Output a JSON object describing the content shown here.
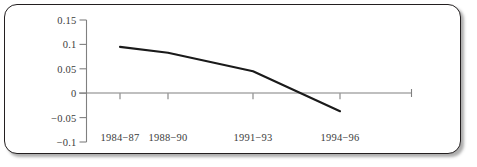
{
  "figure": {
    "frame_border_color": "#231f20",
    "background_color": "#ffffff",
    "axis_color": "#808080",
    "series_color": "#1a1a1a",
    "tick_text_color": "#3b3b3b"
  },
  "chart_data": {
    "type": "line",
    "title": "",
    "subtitle": "",
    "xlabel": "",
    "ylabel": "",
    "categories": [
      "1984−87",
      "1988−90",
      "1991−93",
      "1994−96"
    ],
    "x": [
      0,
      1,
      2,
      3
    ],
    "series": [
      {
        "name": "",
        "values": [
          0.095,
          0.083,
          0.045,
          -0.037
        ]
      }
    ],
    "ylim": [
      -0.1,
      0.15
    ],
    "yticks": [
      0.15,
      0.1,
      0.05,
      0,
      -0.05,
      -0.1
    ],
    "ytick_labels": [
      "0.15",
      "0.1",
      "0.05",
      "0",
      "−0.05",
      "−0.1"
    ],
    "xtick_labels": [
      "1984−87",
      "1988−90",
      "1991−93",
      "1994−96"
    ],
    "grid": false,
    "legend": null,
    "legend_position": "none",
    "zero_line": true,
    "annotations": []
  }
}
